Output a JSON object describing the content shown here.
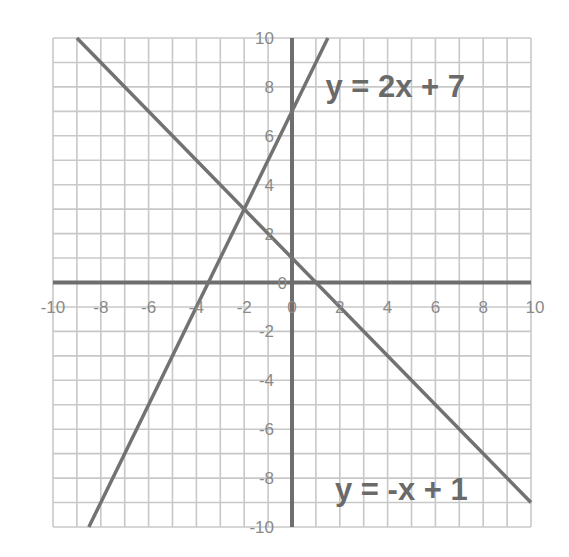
{
  "chart_data": {
    "type": "line",
    "title": "",
    "xlabel": "",
    "ylabel": "",
    "xlim": [
      -10,
      10
    ],
    "ylim": [
      -10,
      10
    ],
    "grid": true,
    "grid_step": 1,
    "x_ticks": [
      -10,
      -8,
      -6,
      -4,
      -2,
      0,
      2,
      4,
      6,
      8,
      10
    ],
    "y_ticks": [
      -10,
      -8,
      -6,
      -4,
      -2,
      0,
      2,
      4,
      6,
      8,
      10
    ],
    "series": [
      {
        "name": "y = 2x + 7",
        "slope": 2,
        "intercept": 7,
        "x": [
          -8.5,
          1.5
        ],
        "y": [
          -10,
          10
        ]
      },
      {
        "name": "y = -x + 1",
        "slope": -1,
        "intercept": 1,
        "x": [
          -9,
          10
        ],
        "y": [
          10,
          -9
        ]
      }
    ],
    "annotations": [
      {
        "text": "y = 2x + 7",
        "x": 1.4,
        "y": 7.6
      },
      {
        "text": "y = -x + 1",
        "x": 1.8,
        "y": -8.9
      }
    ],
    "intersection": {
      "x": -2,
      "y": 3
    },
    "colors": {
      "grid": "#c8c8c8",
      "axes": "#6e6e6e",
      "lines": "#727272",
      "tick_labels": "#8a8a8a",
      "equation_labels": "#6a6a6a"
    }
  }
}
